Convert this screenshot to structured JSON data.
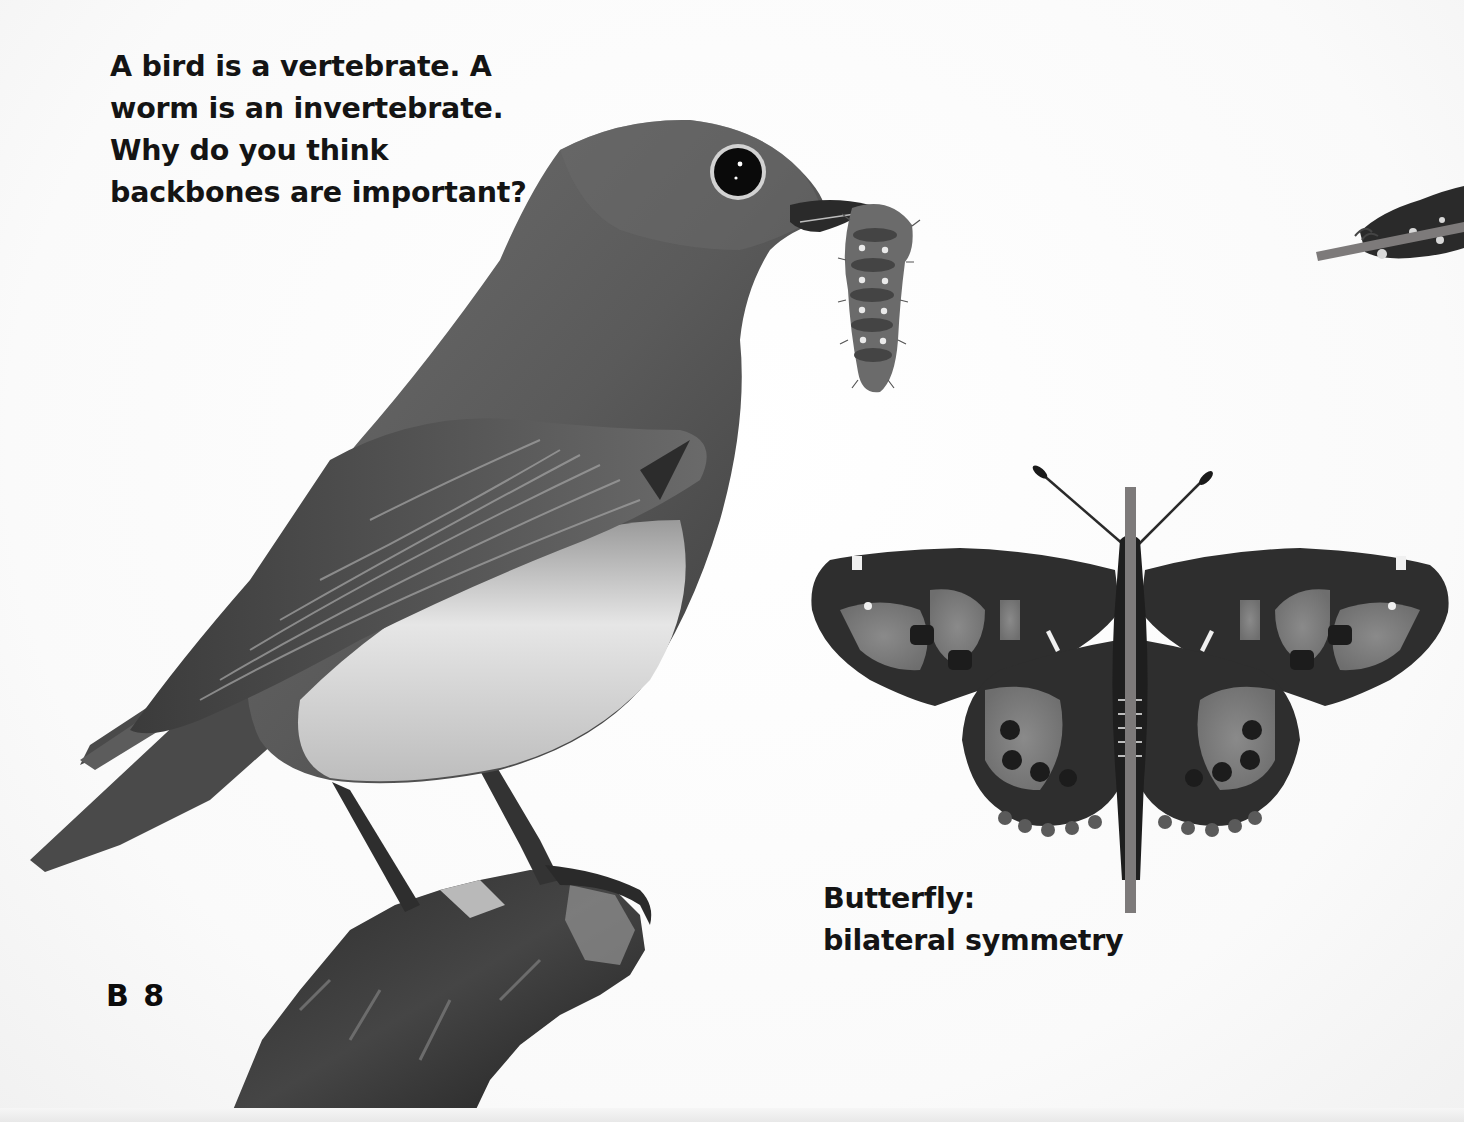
{
  "page": {
    "question": {
      "lines": [
        "A bird is a vertebrate. A",
        "worm is an invertebrate.",
        "Why do you think",
        "backbones are important?"
      ]
    },
    "caption": {
      "lines": [
        "Butterfly:",
        "bilateral symmetry"
      ]
    },
    "folio": "B 8"
  },
  "images": {
    "bird": {
      "label": "bird-with-caterpillar-photo",
      "subject": "bird perched on branch holding a caterpillar"
    },
    "butterfly": {
      "label": "butterfly-photo",
      "subject": "butterfly with wings spread, symmetry line through body"
    },
    "partial_caterpillar": {
      "label": "caterpillar-partial-photo",
      "subject": "caterpillar cropped at right edge with symmetry line"
    }
  },
  "colors": {
    "symmetry_line": "#7d7a7a",
    "text": "#141414",
    "background": "#ffffff"
  }
}
